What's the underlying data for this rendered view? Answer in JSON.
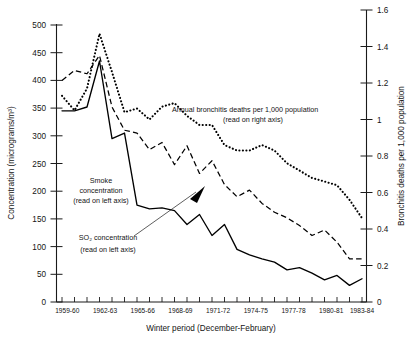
{
  "chart_data": {
    "type": "line",
    "title": "",
    "xlabel": "Winter period (December-February)",
    "ylabel": "Concentration (micrograms/m³)",
    "y2label": "Bronchitis deaths per 1,000 population",
    "ylim": [
      0,
      500
    ],
    "y2lim": [
      0,
      1.6
    ],
    "grid": false,
    "legend_position": "inline-annotations",
    "x": [
      "1959-60",
      "1960-61",
      "1961-62",
      "1962-63",
      "1963-64",
      "1964-65",
      "1965-66",
      "1966-67",
      "1967-68",
      "1968-69",
      "1969-70",
      "1970-71",
      "1971-72",
      "1972-73",
      "1973-74",
      "1974-75",
      "1975-76",
      "1976-77",
      "1977-78",
      "1978-79",
      "1979-80",
      "1980-81",
      "1981-82",
      "1982-83",
      "1983-84"
    ],
    "xtick_labels": [
      "1959-60",
      "1962-63",
      "1965-66",
      "1968-69",
      "1971-72",
      "1974-75",
      "1977-78",
      "1980-81",
      "1983-84"
    ],
    "ytick_labels": [
      "0",
      "50",
      "100",
      "150",
      "200",
      "250",
      "300",
      "350",
      "400",
      "450",
      "500"
    ],
    "y2tick_labels": [
      "0",
      "0.2",
      "0.4",
      "0.6",
      "0.8",
      "1",
      "1.2",
      "1.4",
      "1.6"
    ],
    "series": [
      {
        "name": "Smoke concentration",
        "axis": "left",
        "style": "dashed",
        "units": "micrograms/m³",
        "values": [
          400,
          418,
          412,
          445,
          352,
          310,
          305,
          275,
          288,
          248,
          282,
          232,
          255,
          212,
          190,
          202,
          178,
          162,
          152,
          138,
          120,
          130,
          108,
          78,
          78
        ]
      },
      {
        "name": "SO2 concentration",
        "axis": "left",
        "style": "solid",
        "units": "micrograms/m³",
        "values": [
          345,
          345,
          352,
          435,
          295,
          305,
          175,
          168,
          170,
          165,
          140,
          158,
          120,
          140,
          95,
          85,
          78,
          72,
          58,
          62,
          52,
          40,
          48,
          30,
          42
        ]
      },
      {
        "name": "Annual bronchitis deaths per 1,000 population",
        "axis": "right",
        "style": "dotted",
        "units": "deaths per 1,000 population",
        "values": [
          1.13,
          1.05,
          1.17,
          1.47,
          1.26,
          1.04,
          1.06,
          1.0,
          1.07,
          1.09,
          1.02,
          0.97,
          0.97,
          0.86,
          0.83,
          0.83,
          0.86,
          0.83,
          0.76,
          0.72,
          0.68,
          0.66,
          0.64,
          0.56,
          0.46
        ]
      }
    ],
    "annotations": [
      {
        "name": "bronchitis-annotation",
        "lines": [
          "Annual bronchitis deaths per 1,000 population",
          "(read on right axis)"
        ]
      },
      {
        "name": "smoke-annotation",
        "lines": [
          "Smoke",
          "concentration",
          "(read on left axis)"
        ]
      },
      {
        "name": "so2-annotation",
        "lines": [
          "SO₂ concentration",
          "(read on left axis)"
        ],
        "has_arrow": true
      }
    ]
  },
  "axes": {
    "left_title": "Concentration (micrograms/m³)",
    "right_title": "Bronchitis deaths per 1,000 population",
    "bottom_title": "Winter period (December-February)"
  },
  "ylabels": {
    "t0": "0",
    "t1": "50",
    "t2": "100",
    "t3": "150",
    "t4": "200",
    "t5": "250",
    "t6": "300",
    "t7": "350",
    "t8": "400",
    "t9": "450",
    "t10": "500"
  },
  "y2labels": {
    "t0": "0",
    "t1": "0.2",
    "t2": "0.4",
    "t3": "0.6",
    "t4": "0.8",
    "t5": "1",
    "t6": "1.2",
    "t7": "1.4",
    "t8": "1.6"
  },
  "xlabels": {
    "t0": "1959-60",
    "t1": "1962-63",
    "t2": "1965-66",
    "t3": "1968-69",
    "t4": "1971-72",
    "t5": "1974-75",
    "t6": "1977-78",
    "t7": "1980-81",
    "t8": "1983-84"
  },
  "annotations": {
    "bronchitis_l1": "Annual bronchitis deaths per 1,000 population",
    "bronchitis_l2": "(read on right axis)",
    "smoke_l1": "Smoke",
    "smoke_l2": "concentration",
    "smoke_l3": "(read on left axis)",
    "so2_l1": "SO₂ concentration",
    "so2_l2": "(read on left axis)"
  }
}
